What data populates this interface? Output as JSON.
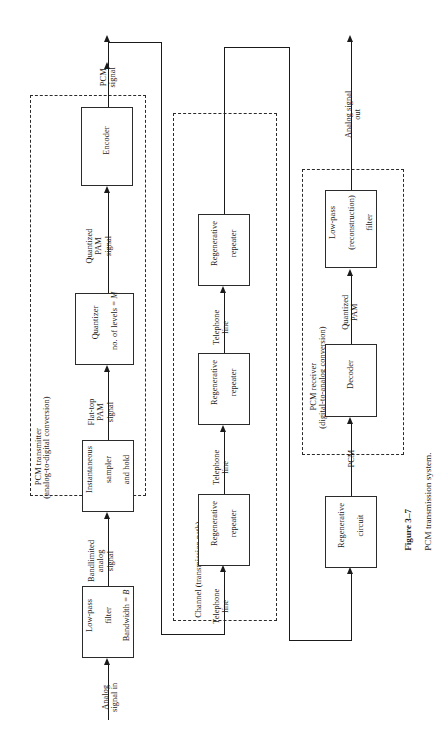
{
  "figure": {
    "number": "Figure 3–7",
    "caption": "PCM transmission system.",
    "title": "PCM transmission system"
  },
  "groups": {
    "transmitter": {
      "line1": "PCM transmitter",
      "line2": "(analog-to-digital conversion)"
    },
    "channel": {
      "line1": "Channel (transmission path)"
    },
    "receiver": {
      "line1": "PCM receiver",
      "line2": "(digital-to-analog conversion)"
    }
  },
  "blocks": {
    "lowpass_filter": {
      "line1": "Low-pass",
      "line2": "filter",
      "line3": "Bandwidth = ",
      "line3_italic": "B"
    },
    "sampler": {
      "line1": "Instantaneous",
      "line2": "sampler",
      "line3": "and hold"
    },
    "quantizer": {
      "line1": "Quantizer",
      "line2": "no. of levels = ",
      "line2_italic": "M"
    },
    "encoder": {
      "line1": "Encoder"
    },
    "repeater1": {
      "line1": "Regenerative",
      "line2": "repeater"
    },
    "repeater2": {
      "line1": "Regenerative",
      "line2": "repeater"
    },
    "repeater3": {
      "line1": "Regenerative",
      "line2": "repeater"
    },
    "regen_circuit": {
      "line1": "Regenerative",
      "line2": "circuit"
    },
    "decoder": {
      "line1": "Decoder"
    },
    "reconstruction_filter": {
      "line1": "Low-pass",
      "line2": "(reconstruction)",
      "line3": "filter"
    }
  },
  "signals": {
    "analog_in": "Analog\nsignal in",
    "bandlimited": "Bandlimited\nanalog\nsignal",
    "flat_top_pam": "Flat-top\nPAM\nsignal",
    "quantized_pam": "Quantized\nPAM\nsignal",
    "pcm_signal": "PCM\nsignal",
    "telephone_line_1": "Telephone\nline",
    "telephone_line_2": "Telephone\nline",
    "telephone_line_3": "Telephone\nline",
    "pcm_in": "PCM",
    "quantized_pam_rx": "Quantized\nPAM",
    "analog_out": "Analog signal\nout"
  },
  "style": {
    "ink": "#1a1a1a",
    "box_border": "#2b2b2b",
    "background": "#ffffff"
  }
}
